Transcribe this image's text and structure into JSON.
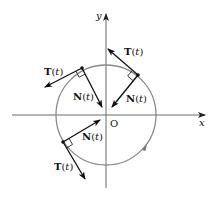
{
  "diagram": {
    "axes": {
      "x_label": "x",
      "y_label": "y",
      "origin_label": "O"
    },
    "colors": {
      "circle": "#8a8a8a",
      "axis": "#6a6a6a",
      "vector": "#111111",
      "text": "#111111"
    },
    "vectors": [
      {
        "point": "upper-right",
        "tangent_label": "T",
        "normal_label": "N",
        "arg": "(t)"
      },
      {
        "point": "upper-left",
        "tangent_label": "T",
        "normal_label": "N",
        "arg": "(t)"
      },
      {
        "point": "lower-left",
        "tangent_label": "T",
        "normal_label": "N",
        "arg": "(t)"
      }
    ],
    "labels": {
      "T_prefix": "T",
      "N_prefix": "N",
      "open_paren": "(",
      "t_var": "t",
      "close_paren": ")"
    }
  }
}
